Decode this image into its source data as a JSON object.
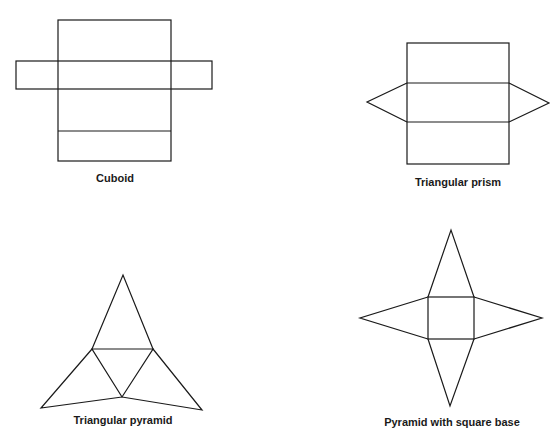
{
  "nets": [
    {
      "name": "Cuboid",
      "label": "Cuboid"
    },
    {
      "name": "Triangular prism",
      "label": "Triangular prism"
    },
    {
      "name": "Triangular pyramid",
      "label": "Triangular pyramid"
    },
    {
      "name": "Pyramid with square base",
      "label": "Pyramid with square base"
    }
  ],
  "colors": {
    "stroke": "#1a1a1a",
    "background": "#ffffff"
  }
}
